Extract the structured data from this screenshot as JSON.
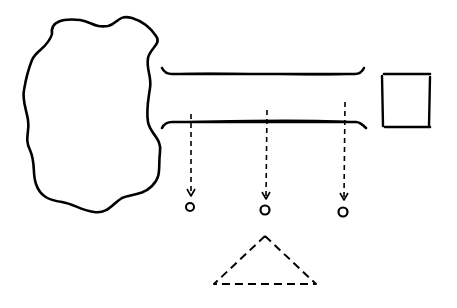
{
  "diagram": {
    "background": "#ffffff",
    "ink": "#000000",
    "shapes": {
      "blob": {
        "label": ""
      },
      "bar_top": {
        "label": ""
      },
      "bar_bottom": {
        "label": ""
      },
      "square": {
        "label": ""
      },
      "arrows": [
        {
          "x": 190,
          "y1": 128,
          "y2": 195
        },
        {
          "x": 267,
          "y1": 112,
          "y2": 198
        },
        {
          "x": 345,
          "y1": 102,
          "y2": 200
        }
      ],
      "circles": [
        {
          "cx": 190,
          "cy": 207,
          "r": 4
        },
        {
          "cx": 265,
          "cy": 210,
          "r": 4.5
        },
        {
          "cx": 343,
          "cy": 212,
          "r": 4.5
        }
      ],
      "triangle": {
        "apex": [
          265,
          236
        ],
        "left": [
          214,
          284
        ],
        "right": [
          316,
          284
        ]
      }
    }
  }
}
